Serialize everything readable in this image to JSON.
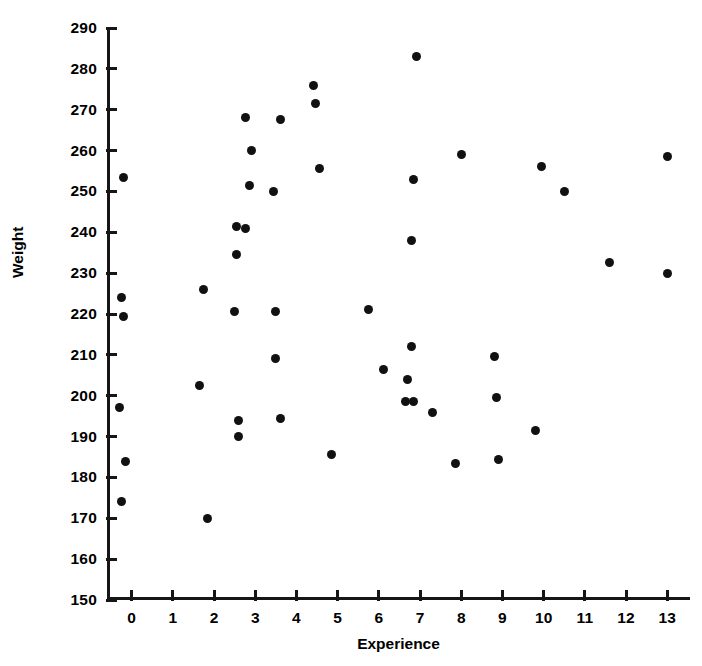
{
  "chart_data": {
    "type": "scatter",
    "title": "",
    "xlabel": "Experience",
    "ylabel": "Weight",
    "xlim": [
      -0.6,
      13.55
    ],
    "ylim": [
      150,
      290
    ],
    "xticks": [
      0,
      1,
      2,
      3,
      4,
      5,
      6,
      7,
      8,
      9,
      10,
      11,
      12,
      13
    ],
    "xtick_labels": [
      "0",
      "1",
      "2",
      "3",
      "4",
      "5",
      "6",
      "7",
      "8",
      "9",
      "10",
      "11",
      "12",
      "13"
    ],
    "yticks": [
      150,
      160,
      170,
      180,
      190,
      200,
      210,
      220,
      230,
      240,
      250,
      260,
      270,
      280,
      290
    ],
    "ytick_labels": [
      "150",
      "160",
      "170",
      "180",
      "190",
      "200",
      "210",
      "220",
      "230",
      "240",
      "250",
      "260",
      "270",
      "280",
      "290"
    ],
    "grid": false,
    "legend": false,
    "marker": "filled-circle",
    "marker_color": "#111111",
    "n_points": 51,
    "points": [
      {
        "x": -0.2,
        "y": 253.5
      },
      {
        "x": -0.25,
        "y": 224.0
      },
      {
        "x": -0.2,
        "y": 219.5
      },
      {
        "x": -0.3,
        "y": 197.0
      },
      {
        "x": -0.15,
        "y": 184.0
      },
      {
        "x": -0.25,
        "y": 174.0
      },
      {
        "x": 1.75,
        "y": 226.0
      },
      {
        "x": 1.65,
        "y": 202.5
      },
      {
        "x": 1.85,
        "y": 170.0
      },
      {
        "x": 2.55,
        "y": 241.5
      },
      {
        "x": 2.75,
        "y": 241.0
      },
      {
        "x": 2.55,
        "y": 234.5
      },
      {
        "x": 2.5,
        "y": 220.5
      },
      {
        "x": 2.6,
        "y": 194.0
      },
      {
        "x": 2.6,
        "y": 190.0
      },
      {
        "x": 2.75,
        "y": 268.0
      },
      {
        "x": 2.9,
        "y": 260.0
      },
      {
        "x": 2.85,
        "y": 251.5
      },
      {
        "x": 3.45,
        "y": 250.0
      },
      {
        "x": 3.6,
        "y": 267.5
      },
      {
        "x": 3.5,
        "y": 220.5
      },
      {
        "x": 3.5,
        "y": 209.0
      },
      {
        "x": 3.6,
        "y": 194.5
      },
      {
        "x": 4.4,
        "y": 276.0
      },
      {
        "x": 4.45,
        "y": 271.5
      },
      {
        "x": 4.55,
        "y": 255.5
      },
      {
        "x": 4.85,
        "y": 185.5
      },
      {
        "x": 5.75,
        "y": 221.0
      },
      {
        "x": 6.1,
        "y": 206.5
      },
      {
        "x": 6.65,
        "y": 198.5
      },
      {
        "x": 6.7,
        "y": 204.0
      },
      {
        "x": 6.8,
        "y": 212.0
      },
      {
        "x": 6.85,
        "y": 198.5
      },
      {
        "x": 6.8,
        "y": 238.0
      },
      {
        "x": 6.85,
        "y": 253.0
      },
      {
        "x": 6.9,
        "y": 283.0
      },
      {
        "x": 7.3,
        "y": 196.0
      },
      {
        "x": 7.85,
        "y": 183.5
      },
      {
        "x": 8.0,
        "y": 259.0
      },
      {
        "x": 8.8,
        "y": 209.5
      },
      {
        "x": 8.85,
        "y": 199.5
      },
      {
        "x": 8.9,
        "y": 184.5
      },
      {
        "x": 9.8,
        "y": 191.5
      },
      {
        "x": 9.95,
        "y": 256.0
      },
      {
        "x": 10.5,
        "y": 250.0
      },
      {
        "x": 11.6,
        "y": 232.5
      },
      {
        "x": 13.0,
        "y": 258.5
      },
      {
        "x": 13.0,
        "y": 230.0
      }
    ]
  },
  "axes": {
    "x_title": "Experience",
    "y_title": "Weight"
  }
}
